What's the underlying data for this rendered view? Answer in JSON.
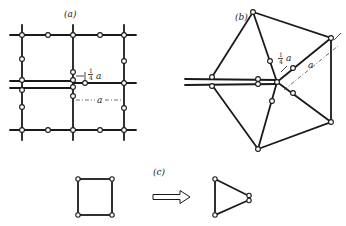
{
  "panels": {
    "a": {
      "label": "(a)",
      "frac_num": "1",
      "frac_den": "4",
      "dim_small": "a",
      "dim_large": "a"
    },
    "b": {
      "label": "(b)",
      "frac_num": "1",
      "frac_den": "4",
      "dim_small": "a",
      "dim_large": "a"
    },
    "c": {
      "label": "(c)"
    }
  },
  "colors": {
    "line": "#1a1a1a",
    "background": "#ffffff"
  }
}
